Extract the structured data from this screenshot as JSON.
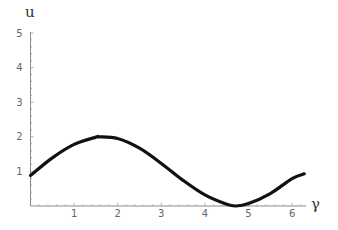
{
  "chart_data": {
    "type": "line",
    "title": "",
    "xlabel": "γ",
    "ylabel": "u",
    "xlim": [
      0,
      6.3
    ],
    "ylim": [
      0,
      5
    ],
    "grid": false,
    "legend": null,
    "x_ticks": [
      1,
      2,
      3,
      4,
      5,
      6
    ],
    "y_ticks": [
      1,
      2,
      3,
      4,
      5
    ],
    "series": [
      {
        "name": "u(γ)",
        "color": "#111111",
        "x": [
          0,
          0.5,
          1.0,
          1.5,
          1.57,
          2.0,
          2.5,
          3.0,
          3.5,
          4.0,
          4.5,
          4.71,
          5.0,
          5.5,
          6.0,
          6.28
        ],
        "values": [
          0.88,
          1.39,
          1.78,
          1.99,
          2.0,
          1.95,
          1.67,
          1.23,
          0.74,
          0.32,
          0.05,
          0.0,
          0.07,
          0.36,
          0.79,
          0.93
        ]
      }
    ]
  },
  "axes": {
    "x_label": "γ",
    "y_label": "u",
    "x_tick_labels": [
      "1",
      "2",
      "3",
      "4",
      "5",
      "6"
    ],
    "y_tick_labels": [
      "1",
      "2",
      "3",
      "4",
      "5"
    ]
  }
}
